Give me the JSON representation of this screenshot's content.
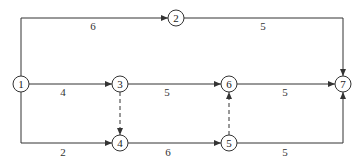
{
  "diagram": {
    "type": "activity-on-arrow network",
    "nodes": [
      {
        "id": "1",
        "label": "1",
        "x": 21,
        "y": 84
      },
      {
        "id": "2",
        "label": "2",
        "x": 176,
        "y": 18
      },
      {
        "id": "3",
        "label": "3",
        "x": 120,
        "y": 84
      },
      {
        "id": "4",
        "label": "4",
        "x": 120,
        "y": 143
      },
      {
        "id": "5",
        "label": "5",
        "x": 229,
        "y": 143
      },
      {
        "id": "6",
        "label": "6",
        "x": 229,
        "y": 84
      },
      {
        "id": "7",
        "label": "7",
        "x": 343,
        "y": 84
      }
    ],
    "edges": [
      {
        "from": "1",
        "to": "2",
        "duration": "6",
        "dashed": false
      },
      {
        "from": "2",
        "to": "7",
        "duration": "5",
        "dashed": false
      },
      {
        "from": "1",
        "to": "3",
        "duration": "4",
        "dashed": false
      },
      {
        "from": "3",
        "to": "6",
        "duration": "5",
        "dashed": false
      },
      {
        "from": "6",
        "to": "7",
        "duration": "5",
        "dashed": false
      },
      {
        "from": "1",
        "to": "4",
        "duration": "2",
        "dashed": false
      },
      {
        "from": "4",
        "to": "5",
        "duration": "6",
        "dashed": false
      },
      {
        "from": "5",
        "to": "7",
        "duration": "5",
        "dashed": false
      },
      {
        "from": "3",
        "to": "4",
        "duration": "",
        "dashed": true
      },
      {
        "from": "5",
        "to": "6",
        "duration": "",
        "dashed": true
      }
    ]
  }
}
